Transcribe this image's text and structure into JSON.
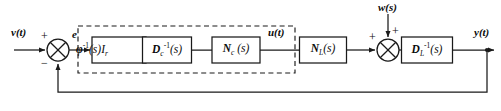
{
  "diagram": {
    "stroke_color": "#1a1a1a",
    "background": "#ffffff",
    "signals": {
      "input": "v(t)",
      "error": "e",
      "control": "u(t)",
      "disturbance": "w(s)",
      "output": "y(t)"
    },
    "signs": {
      "sum1_plus": "+",
      "sum1_minus": "−",
      "sum2_plus_left": "+",
      "sum2_plus_top": "+"
    },
    "blocks": [
      {
        "id": "phi-inv",
        "label_html": "φ<sup>-1</sup><span class='nb'>(s)</span><span class='nb'>I</span><sub>r</sub>",
        "label_text": "phi^-1(s)I_r",
        "x": 92,
        "y": 50,
        "w": 54,
        "h": 26
      },
      {
        "id": "dc-inv",
        "label_html": "D<sub>c</sub><sup>-1</sup><span class='nb'>(s)</span>",
        "label_text": "D_c^-1(s)",
        "x": 167,
        "y": 50,
        "w": 49,
        "h": 26
      },
      {
        "id": "nc",
        "label_html": "N<sub>c</sub> <span class='nb'>(s)</span>",
        "label_text": "N_c(s)",
        "x": 236,
        "y": 50,
        "w": 48,
        "h": 26
      },
      {
        "id": "nl",
        "label_html": "N<sub>L</sub><span class='nb'>(s)</span>",
        "label_text": "N_L(s)",
        "x": 323,
        "y": 50,
        "w": 47,
        "h": 26
      },
      {
        "id": "dl-inv",
        "label_html": "D<sub>L</sub><sup>-1</sup><span class='nb'>(s)</span>",
        "label_text": "D_L^-1(s)",
        "x": 427,
        "y": 50,
        "w": 51,
        "h": 26
      }
    ],
    "controller_group": {
      "label": "controller",
      "x": 78,
      "y": 26,
      "w": 217,
      "h": 47,
      "style": "dashed"
    },
    "summing_junctions": [
      {
        "id": "sum-error",
        "cx": 58,
        "cy": 50,
        "r": 11
      },
      {
        "id": "sum-disturb",
        "cx": 388,
        "cy": 50,
        "r": 11
      }
    ],
    "feedback": {
      "tap_x": 487,
      "bottom_y": 92,
      "return_x": 58
    }
  }
}
